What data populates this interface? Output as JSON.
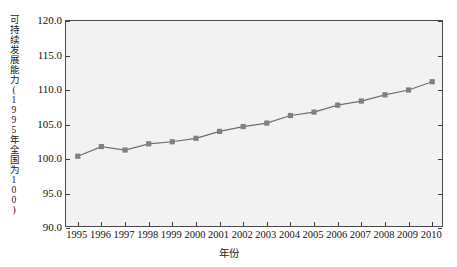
{
  "chart_data": {
    "type": "line",
    "title": "",
    "xlabel": "年份",
    "ylabel": "可持续发展能力(1995年全国为100)",
    "categories": [
      "1995",
      "1996",
      "1997",
      "1998",
      "1999",
      "2000",
      "2001",
      "2002",
      "2003",
      "2004",
      "2005",
      "2006",
      "2007",
      "2008",
      "2009",
      "2010"
    ],
    "x": [
      1995,
      1996,
      1997,
      1998,
      1999,
      2000,
      2001,
      2002,
      2003,
      2004,
      2005,
      2006,
      2007,
      2008,
      2009,
      2010
    ],
    "values": [
      100.4,
      101.8,
      101.3,
      102.2,
      102.5,
      103.0,
      104.0,
      104.7,
      105.2,
      106.3,
      106.8,
      107.8,
      108.4,
      109.3,
      110.0,
      111.2
    ],
    "series": [
      {
        "name": "可持续发展能力",
        "values": [
          100.4,
          101.8,
          101.3,
          102.2,
          102.5,
          103.0,
          104.0,
          104.7,
          105.2,
          106.3,
          106.8,
          107.8,
          108.4,
          109.3,
          110.0,
          111.2
        ]
      }
    ],
    "ylim": [
      90.0,
      120.0
    ],
    "yticks": [
      90.0,
      95.0,
      100.0,
      105.0,
      110.0,
      115.0,
      120.0
    ],
    "ytick_labels": [
      "90.0",
      "95.0",
      "100.0",
      "105.0",
      "110.0",
      "115.0",
      "120.0"
    ],
    "xlim": [
      1994.5,
      2010.5
    ],
    "grid": false,
    "legend": "none",
    "marker": "square",
    "line_color": "#6e6e6e",
    "marker_color": "#808080",
    "plot_background": "#f2f2f2",
    "axis_color": "#4a4a4a"
  }
}
